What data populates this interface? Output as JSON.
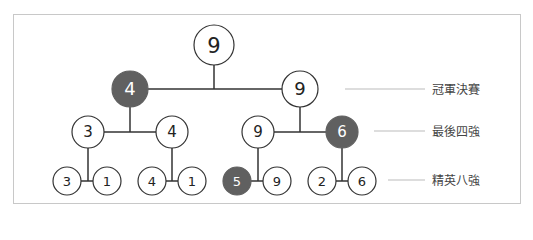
{
  "colors": {
    "highlight": "#606060",
    "line": "#333333",
    "label_line": "#bbbbbb",
    "border": "#c8c8c8"
  },
  "levels": [
    {
      "label": "冠軍決賽",
      "line": [
        345,
        425
      ],
      "y": 89
    },
    {
      "label": "最後四強",
      "line": [
        374,
        425
      ],
      "y": 131
    },
    {
      "label": "精英八強",
      "line": [
        388,
        425
      ],
      "y": 180
    }
  ],
  "nodes": [
    {
      "id": "root",
      "value": "9",
      "x": 214,
      "y": 45,
      "r": 20,
      "highlight": false,
      "font": 21
    },
    {
      "id": "f-left",
      "value": "4",
      "x": 130,
      "y": 89,
      "r": 18,
      "highlight": true,
      "font": 18
    },
    {
      "id": "f-right",
      "value": "9",
      "x": 300,
      "y": 89,
      "r": 18,
      "highlight": false,
      "font": 18
    },
    {
      "id": "sf-1",
      "value": "3",
      "x": 88,
      "y": 132,
      "r": 16,
      "highlight": false,
      "font": 15
    },
    {
      "id": "sf-2",
      "value": "4",
      "x": 172,
      "y": 132,
      "r": 16,
      "highlight": false,
      "font": 15
    },
    {
      "id": "sf-3",
      "value": "9",
      "x": 258,
      "y": 132,
      "r": 16,
      "highlight": false,
      "font": 15
    },
    {
      "id": "sf-4",
      "value": "6",
      "x": 342,
      "y": 132,
      "r": 16,
      "highlight": true,
      "font": 15
    },
    {
      "id": "qf-1",
      "value": "3",
      "x": 67,
      "y": 181,
      "r": 14,
      "highlight": false,
      "font": 13
    },
    {
      "id": "qf-2",
      "value": "1",
      "x": 107,
      "y": 181,
      "r": 14,
      "highlight": false,
      "font": 13
    },
    {
      "id": "qf-3",
      "value": "4",
      "x": 152,
      "y": 181,
      "r": 14,
      "highlight": false,
      "font": 13
    },
    {
      "id": "qf-4",
      "value": "1",
      "x": 192,
      "y": 181,
      "r": 14,
      "highlight": false,
      "font": 13
    },
    {
      "id": "qf-5",
      "value": "5",
      "x": 237,
      "y": 181,
      "r": 14,
      "highlight": true,
      "font": 13
    },
    {
      "id": "qf-6",
      "value": "9",
      "x": 277,
      "y": 181,
      "r": 14,
      "highlight": false,
      "font": 13
    },
    {
      "id": "qf-7",
      "value": "2",
      "x": 322,
      "y": 181,
      "r": 14,
      "highlight": false,
      "font": 13
    },
    {
      "id": "qf-8",
      "value": "6",
      "x": 362,
      "y": 181,
      "r": 14,
      "highlight": false,
      "font": 13
    }
  ],
  "edges": [
    {
      "x1": 148,
      "y1": 89,
      "x2": 282,
      "y2": 89
    },
    {
      "x1": 214,
      "y1": 65,
      "x2": 214,
      "y2": 89
    },
    {
      "x1": 104,
      "y1": 132,
      "x2": 156,
      "y2": 132
    },
    {
      "x1": 130,
      "y1": 107,
      "x2": 130,
      "y2": 132
    },
    {
      "x1": 274,
      "y1": 132,
      "x2": 326,
      "y2": 132
    },
    {
      "x1": 300,
      "y1": 107,
      "x2": 300,
      "y2": 132
    },
    {
      "x1": 81,
      "y1": 181,
      "x2": 93,
      "y2": 181
    },
    {
      "x1": 88,
      "y1": 148,
      "x2": 88,
      "y2": 181
    },
    {
      "x1": 166,
      "y1": 181,
      "x2": 178,
      "y2": 181
    },
    {
      "x1": 172,
      "y1": 148,
      "x2": 172,
      "y2": 181
    },
    {
      "x1": 251,
      "y1": 181,
      "x2": 263,
      "y2": 181
    },
    {
      "x1": 258,
      "y1": 148,
      "x2": 258,
      "y2": 181
    },
    {
      "x1": 336,
      "y1": 181,
      "x2": 348,
      "y2": 181
    },
    {
      "x1": 342,
      "y1": 148,
      "x2": 342,
      "y2": 181
    }
  ]
}
